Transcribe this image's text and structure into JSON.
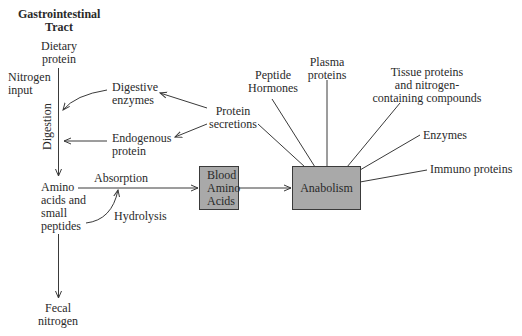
{
  "title": {
    "line1": "Gastrointestinal",
    "line2": "Tract"
  },
  "gi": {
    "dietary": [
      "Dietary",
      "protein"
    ],
    "nitrogen_input": [
      "Nitrogen",
      "input"
    ],
    "digestion": "Digestion",
    "digestive_enzymes": [
      "Digestive",
      "enzymes"
    ],
    "endogenous_protein": [
      "Endogenous",
      "protein"
    ],
    "protein_secretions": [
      "Protein",
      "secretions"
    ],
    "amino": [
      "Amino",
      "acids and",
      "small",
      "peptides"
    ],
    "absorption": "Absorption",
    "hydrolysis": "Hydrolysis",
    "fecal": [
      "Fecal",
      "nitrogen"
    ]
  },
  "boxes": {
    "blood": [
      "Blood",
      "Amino",
      "Acids"
    ],
    "anabolism": "Anabolism"
  },
  "products": {
    "peptide_hormones": [
      "Peptide",
      "Hormones"
    ],
    "plasma_proteins": [
      "Plasma",
      "proteins"
    ],
    "tissue": [
      "Tissue proteins",
      "and nitrogen-",
      "containing compounds"
    ],
    "enzymes": "Enzymes",
    "immuno": "Immuno proteins"
  },
  "colors": {
    "box_fill": "#a9a9a9",
    "stroke": "#3a3a3a",
    "text": "#2a2a2a"
  }
}
